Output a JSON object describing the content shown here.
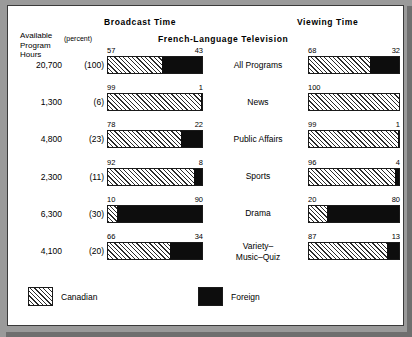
{
  "headers": {
    "broadcast": "Broadcast Time",
    "viewing": "Viewing Time",
    "center": "French-Language  Television"
  },
  "left_column": {
    "title_line1": "Available",
    "title_line2": "Program",
    "title_line3": "Hours",
    "percent_caption": "(percent)"
  },
  "legend": {
    "canadian_label": "Canadian",
    "foreign_label": "Foreign",
    "canadian_color": "#ffffff",
    "foreign_color": "#0d0d0d"
  },
  "chart_data": {
    "type": "bar",
    "title": "French-Language  Television",
    "subtitle": "",
    "xlabel": "",
    "ylabel": "",
    "orientation": "horizontal-stacked",
    "panels": [
      "Broadcast Time",
      "Viewing Time"
    ],
    "legend_entries": [
      "Canadian",
      "Foreign"
    ],
    "legend_position": "bottom-left",
    "grid": false,
    "xlim": [
      0,
      100
    ],
    "categories": [
      "All Programs",
      "News",
      "Public Affairs",
      "Sports",
      "Drama",
      "Variety–\nMusic–Quiz"
    ],
    "rows": [
      {
        "category": "All Programs",
        "category_lines": [
          "All Programs"
        ],
        "available_program_hours": "20,700",
        "percent": "(100)",
        "broadcast": {
          "canadian": 57,
          "foreign": 43
        },
        "viewing": {
          "canadian": 68,
          "foreign": 32
        }
      },
      {
        "category": "News",
        "category_lines": [
          "News"
        ],
        "available_program_hours": "1,300",
        "percent": "(6)",
        "broadcast": {
          "canadian": 99,
          "foreign": 1
        },
        "viewing": {
          "canadian": 100,
          "foreign": 0
        }
      },
      {
        "category": "Public Affairs",
        "category_lines": [
          "Public Affairs"
        ],
        "available_program_hours": "4,800",
        "percent": "(23)",
        "broadcast": {
          "canadian": 78,
          "foreign": 22
        },
        "viewing": {
          "canadian": 99,
          "foreign": 1
        }
      },
      {
        "category": "Sports",
        "category_lines": [
          "Sports"
        ],
        "available_program_hours": "2,300",
        "percent": "(11)",
        "broadcast": {
          "canadian": 92,
          "foreign": 8
        },
        "viewing": {
          "canadian": 96,
          "foreign": 4
        }
      },
      {
        "category": "Drama",
        "category_lines": [
          "Drama"
        ],
        "available_program_hours": "6,300",
        "percent": "(30)",
        "broadcast": {
          "canadian": 10,
          "foreign": 90
        },
        "viewing": {
          "canadian": 20,
          "foreign": 80
        }
      },
      {
        "category": "Variety-Music-Quiz",
        "category_lines": [
          "Variety–",
          "Music–Quiz"
        ],
        "available_program_hours": "4,100",
        "percent": "(20)",
        "broadcast": {
          "canadian": 66,
          "foreign": 34
        },
        "viewing": {
          "canadian": 87,
          "foreign": 13
        }
      }
    ],
    "series": [
      {
        "name": "Canadian",
        "panel": "Broadcast Time",
        "values": [
          57,
          99,
          78,
          92,
          10,
          66
        ]
      },
      {
        "name": "Foreign",
        "panel": "Broadcast Time",
        "values": [
          43,
          1,
          22,
          8,
          90,
          34
        ]
      },
      {
        "name": "Canadian",
        "panel": "Viewing Time",
        "values": [
          68,
          100,
          99,
          96,
          20,
          87
        ]
      },
      {
        "name": "Foreign",
        "panel": "Viewing Time",
        "values": [
          32,
          0,
          1,
          4,
          80,
          13
        ]
      }
    ]
  }
}
